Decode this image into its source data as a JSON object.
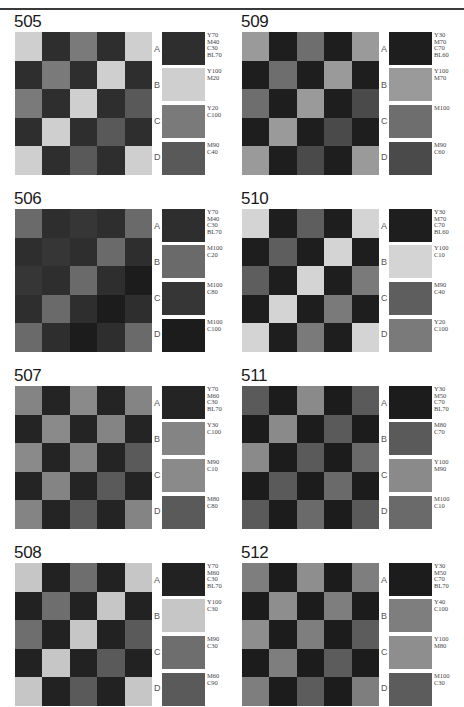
{
  "pattern": [
    [
      "B",
      "A",
      "C",
      "A",
      "B"
    ],
    [
      "A",
      "C",
      "A",
      "B",
      "A"
    ],
    [
      "C",
      "A",
      "B",
      "A",
      "D"
    ],
    [
      "A",
      "B",
      "A",
      "D",
      "A"
    ],
    [
      "B",
      "A",
      "D",
      "A",
      "B"
    ]
  ],
  "letters": [
    "A",
    "B",
    "C",
    "D"
  ],
  "panels": [
    {
      "id": "505",
      "colors": {
        "A": "#2e2e2e",
        "B": "#cfcfcf",
        "C": "#7a7a7a",
        "D": "#595959"
      },
      "labels": {
        "A": "Y70\nM40\nC30\nBL70",
        "B": "Y100\nM20",
        "C": "Y20\nC100",
        "D": "M90\nC40"
      }
    },
    {
      "id": "509",
      "colors": {
        "A": "#1e1e1e",
        "B": "#9a9a9a",
        "C": "#6e6e6e",
        "D": "#4a4a4a"
      },
      "labels": {
        "A": "Y30\nM70\nC70\nBL60",
        "B": "Y100\nM70",
        "C": "M100",
        "D": "M90\nC60"
      }
    },
    {
      "id": "506",
      "colors": {
        "A": "#2e2e2e",
        "B": "#6a6a6a",
        "C": "#363636",
        "D": "#1c1c1c"
      },
      "labels": {
        "A": "Y70\nM40\nC30\nBL70",
        "B": "M100\nC20",
        "C": "M100\nC80",
        "D": "M100\nC100"
      }
    },
    {
      "id": "510",
      "colors": {
        "A": "#1e1e1e",
        "B": "#d4d4d4",
        "C": "#5e5e5e",
        "D": "#7a7a7a"
      },
      "labels": {
        "A": "Y30\nM70\nC70\nBL60",
        "B": "Y100\nC10",
        "C": "M90\nC40",
        "D": "Y20\nC100"
      }
    },
    {
      "id": "507",
      "colors": {
        "A": "#242424",
        "B": "#848484",
        "C": "#8a8a8a",
        "D": "#5a5a5a"
      },
      "labels": {
        "A": "Y70\nM60\nC30\nBL70",
        "B": "Y30\nC100",
        "C": "M90\nC10",
        "D": "M80\nC80"
      }
    },
    {
      "id": "511",
      "colors": {
        "A": "#1c1c1c",
        "B": "#5a5a5a",
        "C": "#8a8a8a",
        "D": "#6a6a6a"
      },
      "labels": {
        "A": "Y30\nM50\nC70\nBL70",
        "B": "M80\nC70",
        "C": "Y100\nM90",
        "D": "M100\nC10"
      }
    },
    {
      "id": "508",
      "colors": {
        "A": "#222222",
        "B": "#c6c6c6",
        "C": "#6e6e6e",
        "D": "#5a5a5a"
      },
      "labels": {
        "A": "Y70\nM60\nC30\nBL70",
        "B": "Y100\nC30",
        "C": "M90\nC30",
        "D": "M60\nC90"
      }
    },
    {
      "id": "512",
      "colors": {
        "A": "#1c1c1c",
        "B": "#7e7e7e",
        "C": "#8e8e8e",
        "D": "#5c5c5c"
      },
      "labels": {
        "A": "Y30\nM50\nC70\nBL70",
        "B": "Y40\nC100",
        "C": "Y100\nM80",
        "D": "M100\nC30"
      }
    }
  ]
}
